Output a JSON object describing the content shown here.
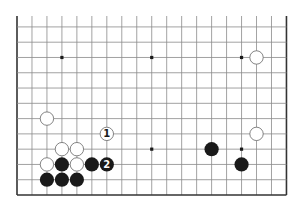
{
  "diagram": {
    "type": "go-board-fragment",
    "board_size": 19,
    "visible_rows": [
      7,
      18
    ],
    "visible_cols": [
      0,
      18
    ],
    "edges": {
      "left": true,
      "right": true,
      "bottom": true,
      "top": false
    },
    "colors": {
      "grid_line": "#8a8a8a",
      "edge_line": "#333333",
      "black_stone": "#1a1a1a",
      "white_stone_fill": "#ffffff",
      "white_stone_stroke": "#666666",
      "background": "#ffffff",
      "hoshi": "#1a1a1a"
    },
    "hoshi": [
      {
        "col": 3,
        "row": 9
      },
      {
        "col": 9,
        "row": 9
      },
      {
        "col": 15,
        "row": 9
      },
      {
        "col": 3,
        "row": 15
      },
      {
        "col": 9,
        "row": 15
      },
      {
        "col": 15,
        "row": 15
      }
    ],
    "stones": [
      {
        "color": "white",
        "col": 16,
        "row": 9,
        "label": ""
      },
      {
        "color": "white",
        "col": 2,
        "row": 13,
        "label": ""
      },
      {
        "color": "white",
        "col": 6,
        "row": 14,
        "label": "1"
      },
      {
        "color": "white",
        "col": 16,
        "row": 14,
        "label": ""
      },
      {
        "color": "white",
        "col": 3,
        "row": 15,
        "label": ""
      },
      {
        "color": "white",
        "col": 4,
        "row": 15,
        "label": ""
      },
      {
        "color": "black",
        "col": 13,
        "row": 15,
        "label": ""
      },
      {
        "color": "white",
        "col": 2,
        "row": 16,
        "label": ""
      },
      {
        "color": "black",
        "col": 3,
        "row": 16,
        "label": ""
      },
      {
        "color": "white",
        "col": 4,
        "row": 16,
        "label": ""
      },
      {
        "color": "black",
        "col": 5,
        "row": 16,
        "label": ""
      },
      {
        "color": "black",
        "col": 6,
        "row": 16,
        "label": "2"
      },
      {
        "color": "black",
        "col": 15,
        "row": 16,
        "label": ""
      },
      {
        "color": "black",
        "col": 2,
        "row": 17,
        "label": ""
      },
      {
        "color": "black",
        "col": 3,
        "row": 17,
        "label": ""
      },
      {
        "color": "black",
        "col": 4,
        "row": 17,
        "label": ""
      }
    ],
    "move_labels": [
      "1",
      "2"
    ]
  }
}
